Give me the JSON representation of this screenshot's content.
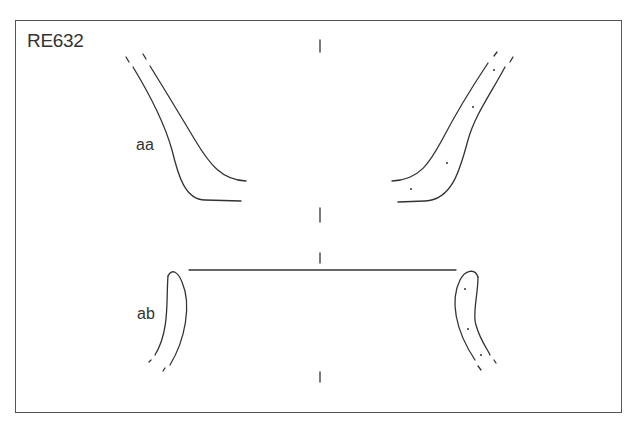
{
  "figure": {
    "id_label": "RE632",
    "sections": [
      {
        "label": "aa",
        "description": "upper profile section (rim/neck)"
      },
      {
        "label": "ab",
        "description": "lower profile section (base/foot)"
      }
    ],
    "line_color": "#333333"
  }
}
